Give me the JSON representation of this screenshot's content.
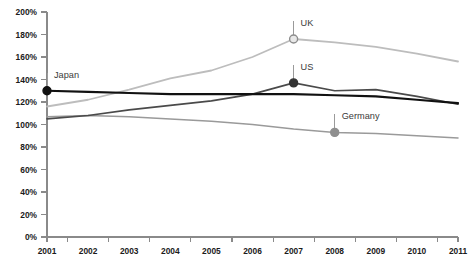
{
  "chart_data": {
    "type": "line",
    "title": "",
    "xlabel": "",
    "ylabel": "",
    "x": [
      2001,
      2002,
      2003,
      2004,
      2005,
      2006,
      2007,
      2008,
      2009,
      2010,
      2011
    ],
    "xticklabels": [
      "2001",
      "2002",
      "2003",
      "2004",
      "2005",
      "2006",
      "2007",
      "2008",
      "2009",
      "2010",
      "2011"
    ],
    "yticklabels": [
      "0%",
      "20%",
      "40%",
      "60%",
      "80%",
      "100%",
      "120%",
      "140%",
      "160%",
      "180%",
      "200%"
    ],
    "yticks": [
      0,
      20,
      40,
      60,
      80,
      100,
      120,
      140,
      160,
      180,
      200
    ],
    "ylim": [
      0,
      200
    ],
    "xlim": [
      2001,
      2011
    ],
    "grid": false,
    "legend": "inline-annotations",
    "series": [
      {
        "name": "Japan",
        "color": "#111111",
        "width": 2.2,
        "values": [
          130,
          129,
          128,
          127,
          127,
          127,
          127,
          126,
          125,
          122,
          119
        ]
      },
      {
        "name": "US",
        "color": "#4a4a4a",
        "width": 1.6,
        "values": [
          105,
          108,
          113,
          117,
          121,
          127,
          137,
          130,
          131,
          125,
          118
        ]
      },
      {
        "name": "UK",
        "color": "#bdbdbd",
        "width": 1.8,
        "values": [
          116,
          122,
          131,
          141,
          148,
          160,
          176,
          173,
          169,
          163,
          156
        ]
      },
      {
        "name": "Germany",
        "color": "#9a9a9a",
        "width": 1.5,
        "values": [
          107,
          108,
          107,
          105,
          103,
          100,
          96,
          93,
          92,
          90,
          88
        ]
      }
    ],
    "annotations": [
      {
        "label": "Japan",
        "series": "Japan",
        "x": 2001,
        "y": 130,
        "marker": "filled-dot",
        "marker_fill": "#111111",
        "marker_stroke": "#111111",
        "marker_radius": 4.0,
        "label_dx": 7,
        "label_dy": -20,
        "leader_dy": -18
      },
      {
        "label": "UK",
        "series": "UK",
        "x": 2007,
        "y": 176,
        "marker": "hollow-dot",
        "marker_fill": "#e8e8e8",
        "marker_stroke": "#8c8c8c",
        "marker_radius": 4.0,
        "label_dx": 7,
        "label_dy": -20,
        "leader_dy": -18
      },
      {
        "label": "US",
        "series": "US",
        "x": 2007,
        "y": 137,
        "marker": "filled-dot",
        "marker_fill": "#333333",
        "marker_stroke": "#333333",
        "marker_radius": 4.0,
        "label_dx": 7,
        "label_dy": -20,
        "leader_dy": -18
      },
      {
        "label": "Germany",
        "series": "Germany",
        "x": 2008,
        "y": 93,
        "marker": "filled-dot",
        "marker_fill": "#8f8f8f",
        "marker_stroke": "#8f8f8f",
        "marker_radius": 4.0,
        "label_dx": 7,
        "label_dy": -20,
        "leader_dy": -18
      }
    ],
    "colors": {
      "axis": "#8a8a8a",
      "tick_text": "#1b1b1b",
      "label_text": "#3a3a3a",
      "background": "#ffffff"
    }
  },
  "layout": {
    "plot_left": 47,
    "plot_right": 458,
    "plot_top": 12,
    "plot_bottom": 237
  }
}
